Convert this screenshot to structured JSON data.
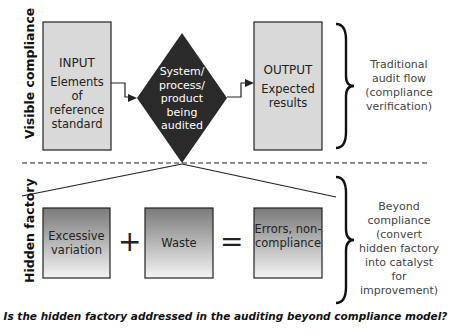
{
  "top_section": {
    "label": "Visible compliance",
    "input_box": {
      "title": "INPUT",
      "body": "Elements of reference standard"
    },
    "process_diamond": {
      "text": "System/ process/ product being audited"
    },
    "output_box": {
      "title": "OUTPUT",
      "body": "Expected results"
    },
    "brace_note": "Traditional audit flow (compliance verification)"
  },
  "bottom_section": {
    "label": "Hidden factory",
    "boxes": [
      {
        "text": "Excessive variation"
      },
      {
        "text": "Waste"
      },
      {
        "text": "Errors, non-compliance"
      }
    ],
    "operators": [
      "+",
      "="
    ],
    "brace_note": "Beyond compliance (convert hidden factory into catalyst for improvement)"
  },
  "caption": "Is the hidden factory addressed in the auditing beyond compliance model?",
  "colors": {
    "box_fill": "#d9d9d9",
    "diamond_fill": "#2a2a2a",
    "gradient_top": "#7a7a7a",
    "gradient_bottom": "#f2f2f2"
  }
}
